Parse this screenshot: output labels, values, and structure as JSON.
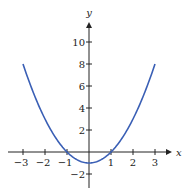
{
  "chart_data": {
    "type": "line",
    "title": "",
    "xlabel": "x",
    "ylabel": "y",
    "function": "y = x^2 - 1",
    "xlim": [
      -3,
      3
    ],
    "ylim": [
      -3,
      11
    ],
    "grid": false,
    "legend": null,
    "x_ticks": [
      -3,
      -2,
      -1,
      1,
      2,
      3
    ],
    "x_tick_labels": [
      "−3",
      "−2",
      "−1",
      "1",
      "2",
      "3"
    ],
    "y_ticks": [
      10,
      8,
      6,
      4,
      2,
      -2
    ],
    "y_tick_labels": [
      "10",
      "8",
      "6",
      "4",
      "2",
      "−2"
    ],
    "series": [
      {
        "name": "y = x^2 - 1",
        "color": "#3a5fb5",
        "x": [
          -3,
          -2.5,
          -2,
          -1.5,
          -1,
          -0.5,
          0,
          0.5,
          1,
          1.5,
          2,
          2.5,
          3
        ],
        "y": [
          8,
          5.25,
          3,
          1.25,
          0,
          -0.75,
          -1,
          -0.75,
          0,
          1.25,
          3,
          5.25,
          8
        ]
      }
    ]
  },
  "layout": {
    "origin_px": [
      89,
      152
    ],
    "x_unit_px": 22,
    "y_unit_px": 11,
    "x_axis_px": [
      8,
      172
    ],
    "y_axis_px": [
      188,
      22
    ],
    "axis_color": "#222222"
  }
}
